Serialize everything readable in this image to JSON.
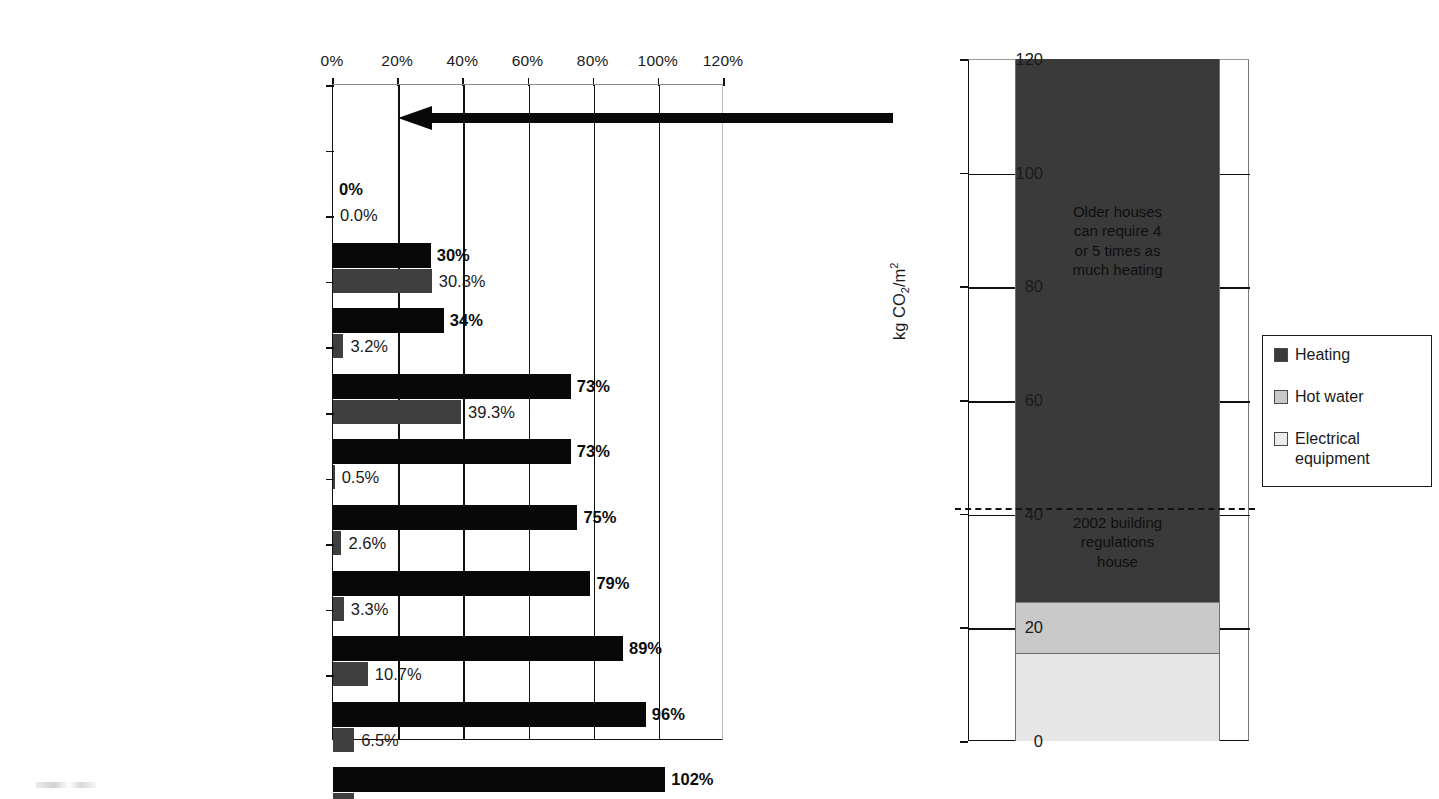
{
  "chart_data": [
    {
      "type": "bar",
      "title": "",
      "orientation": "horizontal",
      "xlabel": "",
      "ylabel": "",
      "xlim": [
        0,
        120
      ],
      "xticks": [
        "0%",
        "20%",
        "40%",
        "60%",
        "80%",
        "100%",
        "120%"
      ],
      "xtick_values": [
        0,
        20,
        40,
        60,
        80,
        100,
        120
      ],
      "grid": true,
      "categories": [
        "Victorian detached house",
        "Upgrade to high efficiency boiler",
        "Reduce electrical demand by 25%",
        "ZED upgrade fabric and\ndraughtproofing",
        "Mechanical heat recovery\nventilation added",
        "Passive HRV used INSTEAD\nof MHRV",
        "Solar hot water added",
        "Biomass heating and hot water\nadded",
        "1 kW wind turbine added",
        "12 m² photovoltaic panels added"
      ],
      "series": [
        {
          "name": "cumulative-saving",
          "color": "#080808",
          "values": [
            0,
            30,
            34,
            73,
            73,
            75,
            79,
            89,
            96,
            102
          ],
          "labels": [
            "0%",
            "30%",
            "34%",
            "73%",
            "73%",
            "75%",
            "79%",
            "89%",
            "96%",
            "102%"
          ]
        },
        {
          "name": "incremental-saving",
          "color": "#3f3f3f",
          "values": [
            0.0,
            30.3,
            3.2,
            39.3,
            0.5,
            2.6,
            3.3,
            10.7,
            6.5,
            6.4
          ],
          "labels": [
            "0.0%",
            "30.3%",
            "3.2%",
            "39.3%",
            "0.5%",
            "2.6%",
            "3.3%",
            "10.7%",
            "6.5%",
            "6.4%"
          ]
        }
      ],
      "annotations": [
        {
          "name": "baseline-arrow",
          "type": "arrow",
          "direction": "left",
          "row": 0
        }
      ]
    },
    {
      "type": "bar",
      "subtype": "stacked",
      "title": "",
      "ylabel": "kg CO2/m2",
      "ylabel_parts": {
        "prefix": "kg CO",
        "sub": "2",
        "mid": "/m",
        "sup": "2"
      },
      "ylim": [
        0,
        120
      ],
      "yticks": [
        "0",
        "20",
        "40",
        "60",
        "80",
        "100",
        "120"
      ],
      "ytick_values": [
        0,
        20,
        40,
        60,
        80,
        100,
        120
      ],
      "grid": true,
      "categories": [
        "Victorian detached house"
      ],
      "stack_segments": [
        {
          "name": "Electrical equipment",
          "value": 15.5,
          "color": "#e6e6e6"
        },
        {
          "name": "Hot water",
          "value": 9.0,
          "color": "#c9c9c9"
        },
        {
          "name": "Heating",
          "value": 95.5,
          "color": "#3a3a3a"
        }
      ],
      "total": 120.0,
      "reference_line": {
        "label": "2002 building regulations house",
        "value": 41.0,
        "style": "dashed"
      },
      "annotations": [
        {
          "name": "older-houses-note",
          "text": "Older houses\ncan require 4\nor 5 times as\nmuch heating",
          "value_center": 88
        },
        {
          "name": "regs-house-note",
          "text": "2002 building\nregulations\nhouse",
          "value_center": 35
        }
      ],
      "legend": {
        "position": "right",
        "entries": [
          {
            "label": "Heating",
            "color": "#3a3a3a"
          },
          {
            "label": "Hot water",
            "color": "#c9c9c9"
          },
          {
            "label": "Electrical\nequipment",
            "color": "#ececec"
          }
        ]
      }
    }
  ],
  "left": {
    "xticks": [
      {
        "label": "0%",
        "value": 0
      },
      {
        "label": "20%",
        "value": 20
      },
      {
        "label": "40%",
        "value": 40
      },
      {
        "label": "60%",
        "value": 60
      },
      {
        "label": "80%",
        "value": 80
      },
      {
        "label": "100%",
        "value": 100
      },
      {
        "label": "120%",
        "value": 120
      }
    ],
    "rows": [
      {
        "name": "Victorian detached house",
        "black": 0,
        "black_label": "0%",
        "gray": 0.0,
        "gray_label": "0.0%"
      },
      {
        "name": "Upgrade to high efficiency boiler",
        "black": 30,
        "black_label": "30%",
        "gray": 30.3,
        "gray_label": "30.3%"
      },
      {
        "name": "Reduce electrical demand by 25%",
        "black": 34,
        "black_label": "34%",
        "gray": 3.2,
        "gray_label": "3.2%"
      },
      {
        "name": "ZED upgrade fabric and\ndraughtproofing",
        "black": 73,
        "black_label": "73%",
        "gray": 39.3,
        "gray_label": "39.3%"
      },
      {
        "name": "Mechanical heat recovery\nventilation added",
        "black": 73,
        "black_label": "73%",
        "gray": 0.5,
        "gray_label": "0.5%"
      },
      {
        "name": "Passive HRV used INSTEAD\nof MHRV",
        "black": 75,
        "black_label": "75%",
        "gray": 2.6,
        "gray_label": "2.6%"
      },
      {
        "name": "Solar hot water added",
        "black": 79,
        "black_label": "79%",
        "gray": 3.3,
        "gray_label": "3.3%"
      },
      {
        "name": "Biomass heating and hot water\nadded",
        "black": 89,
        "black_label": "89%",
        "gray": 10.7,
        "gray_label": "10.7%"
      },
      {
        "name": "1 kW wind turbine added",
        "black": 96,
        "black_label": "96%",
        "gray": 6.5,
        "gray_label": "6.5%"
      },
      {
        "name": "12 m2 photovoltaic panels added",
        "black": 102,
        "black_label": "102%",
        "gray": 6.4,
        "gray_label": "6.4%"
      }
    ],
    "last_row_label_pre": "12 m",
    "last_row_label_sup": "2",
    "last_row_label_post": " photovoltaic panels added"
  },
  "right": {
    "yticks": [
      {
        "label": "0",
        "value": 0
      },
      {
        "label": "20",
        "value": 20
      },
      {
        "label": "40",
        "value": 40
      },
      {
        "label": "60",
        "value": 60
      },
      {
        "label": "80",
        "value": 80
      },
      {
        "label": "100",
        "value": 100
      },
      {
        "label": "120",
        "value": 120
      }
    ],
    "axis_label_prefix": "kg CO",
    "axis_label_sub": "2",
    "axis_label_mid": "/m",
    "axis_label_sup": "2",
    "note_top": "Older houses\ncan require 4\nor 5 times as\nmuch heating",
    "note_bottom": "2002 building\nregulations\nhouse",
    "legend": {
      "heating": "Heating",
      "hot_water": "Hot water",
      "electrical": "Electrical\nequipment"
    }
  }
}
